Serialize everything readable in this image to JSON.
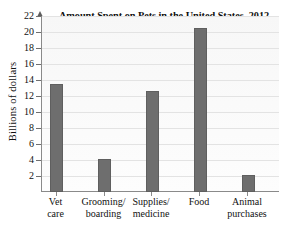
{
  "chart_data": {
    "type": "bar",
    "title": "Amount Spent on Pets in the United States, 2012",
    "xlabel": "",
    "ylabel": "Billions of dollars",
    "categories": [
      "Vet care",
      "Grooming/ boarding",
      "Supplies/ medicine",
      "Food",
      "Animal purchases"
    ],
    "category_lines": [
      [
        "Vet",
        "care"
      ],
      [
        "Grooming/",
        "boarding"
      ],
      [
        "Supplies/",
        "medicine"
      ],
      [
        "Food",
        ""
      ],
      [
        "Animal",
        "purchases"
      ]
    ],
    "values": [
      13.5,
      4.1,
      12.6,
      20.5,
      2.1
    ],
    "ylim": [
      0,
      22
    ],
    "yticks": [
      22,
      20,
      18,
      16,
      14,
      12,
      10,
      8,
      6,
      4,
      2
    ],
    "ytick_labels": [
      "22",
      "20",
      "18",
      "16",
      "14",
      "12",
      "10",
      "8",
      "6",
      "4",
      "2"
    ],
    "grid": true,
    "legend": null,
    "bar_color": "#6e6e6e",
    "axis_color": "#8a8a8a",
    "grid_color": "#e3e3e3",
    "plot_background": "#fbfbfb"
  }
}
